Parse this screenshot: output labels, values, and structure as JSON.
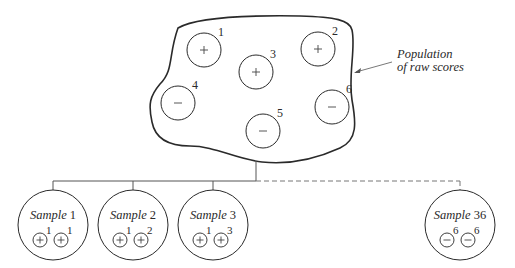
{
  "population": {
    "label_line1": "Population",
    "label_line2": "of raw scores",
    "scores": [
      {
        "id": "1",
        "sign": "+",
        "cx": 204,
        "cy": 50
      },
      {
        "id": "2",
        "sign": "+",
        "cx": 318,
        "cy": 49
      },
      {
        "id": "3",
        "sign": "+",
        "cx": 256,
        "cy": 72
      },
      {
        "id": "4",
        "sign": "−",
        "cx": 178,
        "cy": 103
      },
      {
        "id": "5",
        "sign": "−",
        "cx": 263,
        "cy": 131
      },
      {
        "id": "6",
        "sign": "−",
        "cx": 332,
        "cy": 107
      }
    ]
  },
  "samples": [
    {
      "label_word": "Sample",
      "label_num": "1",
      "cx": 53,
      "items": [
        {
          "sign": "+",
          "id": "1"
        },
        {
          "sign": "+",
          "id": "1"
        }
      ],
      "connector": "solid"
    },
    {
      "label_word": "Sample",
      "label_num": "2",
      "cx": 133,
      "items": [
        {
          "sign": "+",
          "id": "1"
        },
        {
          "sign": "+",
          "id": "2"
        }
      ],
      "connector": "solid"
    },
    {
      "label_word": "Sample",
      "label_num": "3",
      "cx": 213,
      "items": [
        {
          "sign": "+",
          "id": "1"
        },
        {
          "sign": "+",
          "id": "3"
        }
      ],
      "connector": "solid"
    },
    {
      "label_word": "Sample",
      "label_num": "36",
      "cx": 460,
      "items": [
        {
          "sign": "−",
          "id": "6"
        },
        {
          "sign": "−",
          "id": "6"
        }
      ],
      "connector": "dashed"
    }
  ],
  "colors": {
    "stroke": "#2a2a2a",
    "thin_stroke": "#555555",
    "background": "#ffffff"
  }
}
